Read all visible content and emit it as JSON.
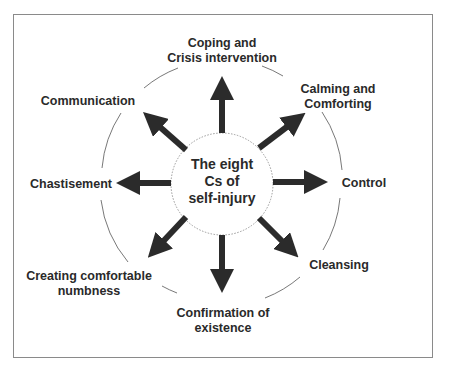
{
  "diagram": {
    "center": {
      "line1": "The eight",
      "line2": "Cs of",
      "line3": "self-injury"
    },
    "nodes": [
      {
        "id": "coping",
        "line1": "Coping and",
        "line2": "Crisis intervention",
        "direction": "up"
      },
      {
        "id": "calming",
        "line1": "Calming and",
        "line2": "Comforting",
        "direction": "up-right"
      },
      {
        "id": "control",
        "line1": "Control",
        "line2": "",
        "direction": "right"
      },
      {
        "id": "cleansing",
        "line1": "Cleansing",
        "line2": "",
        "direction": "down-right"
      },
      {
        "id": "confirmation",
        "line1": "Confirmation of",
        "line2": "existence",
        "direction": "down"
      },
      {
        "id": "numbness",
        "line1": "Creating comfortable",
        "line2": "numbness",
        "direction": "down-left"
      },
      {
        "id": "chastisement",
        "line1": "Chastisement",
        "line2": "",
        "direction": "left"
      },
      {
        "id": "communication",
        "line1": "Communication",
        "line2": "",
        "direction": "up-left"
      }
    ],
    "colors": {
      "arrow": "#2b2b2b",
      "text": "#2a2a2a",
      "frame": "#8a8a8a",
      "circle": "#9a9a9a"
    }
  }
}
